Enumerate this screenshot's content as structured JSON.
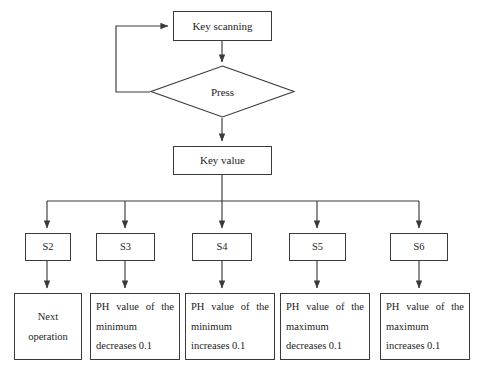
{
  "diagram": {
    "type": "flowchart",
    "line_color": "#3a3a3a",
    "text_color": "#1d1d1d",
    "background_color": "#ffffff",
    "nodes": {
      "key_scanning": "Key scanning",
      "press": "Press",
      "key_value": "Key value"
    },
    "state_labels": [
      "S2",
      "S3",
      "S4",
      "S5",
      "S6"
    ],
    "actions": [
      "Next operation",
      "PH value of the minimum decreases 0.1",
      "PH value of the minimum increases 0.1",
      "PH value of the maximum decreases 0.1",
      "PH value of the maximum increases 0.1"
    ]
  }
}
